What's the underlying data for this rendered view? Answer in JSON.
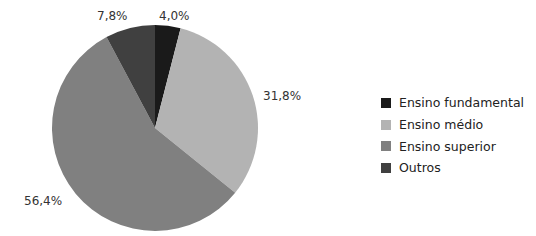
{
  "chart_data": {
    "type": "pie",
    "title": "",
    "categories": [
      "Ensino fundamental",
      "Ensino médio",
      "Ensino superior",
      "Outros"
    ],
    "values": [
      4.0,
      31.8,
      56.4,
      7.8
    ],
    "value_labels": [
      "4,0%",
      "31,8%",
      "56,4%",
      "7,8%"
    ],
    "colors": [
      "#1a1a1a",
      "#b3b3b3",
      "#808080",
      "#404040"
    ],
    "legend_position": "right",
    "start_angle_deg": 0,
    "direction": "clockwise"
  },
  "legend": {
    "items": [
      {
        "label": "Ensino fundamental",
        "color": "#1a1a1a"
      },
      {
        "label": "Ensino médio",
        "color": "#b3b3b3"
      },
      {
        "label": "Ensino superior",
        "color": "#808080"
      },
      {
        "label": "Outros",
        "color": "#404040"
      }
    ]
  },
  "labels": {
    "fundamental": "4,0%",
    "medio": "31,8%",
    "superior": "56,4%",
    "outros": "7,8%"
  }
}
